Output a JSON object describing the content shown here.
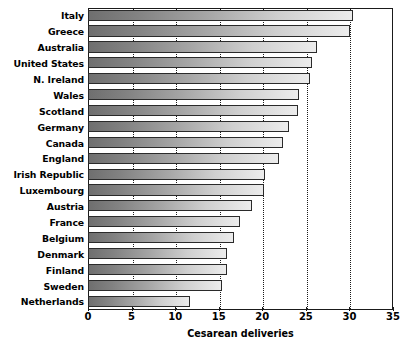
{
  "chart_data": {
    "type": "bar",
    "orientation": "horizontal",
    "title": "",
    "xlabel": "Cesarean deliveries",
    "ylabel": "",
    "xlim": [
      0,
      35
    ],
    "xticks": [
      0,
      5,
      10,
      15,
      20,
      25,
      30,
      35
    ],
    "grid": "vertical dotted gridlines at 5,10,15,20,25,30",
    "legend": "none",
    "categories": [
      "Italy",
      "Greece",
      "Australia",
      "United States",
      "N. Ireland",
      "Wales",
      "Scotland",
      "Germany",
      "Canada",
      "England",
      "Irish Republic",
      "Luxembourg",
      "Austria",
      "France",
      "Belgium",
      "Denmark",
      "Finland",
      "Sweden",
      "Netherlands"
    ],
    "values": [
      30.4,
      30.1,
      26.3,
      25.7,
      25.5,
      24.2,
      24.1,
      23.1,
      22.4,
      21.9,
      20.3,
      20.2,
      18.8,
      17.4,
      16.8,
      15.9,
      15.9,
      15.4,
      11.7
    ]
  },
  "axis": {
    "x_title": "Cesarean deliveries",
    "tick_labels": [
      "0",
      "5",
      "10",
      "15",
      "20",
      "25",
      "30",
      "35"
    ]
  },
  "style": {
    "bar_fill_dark": "#6f6f6f",
    "bar_fill_light": "#ececec",
    "bar_stroke": "#2a2a2a",
    "axis_color": "#1a1a1a",
    "background": "#ffffff"
  }
}
